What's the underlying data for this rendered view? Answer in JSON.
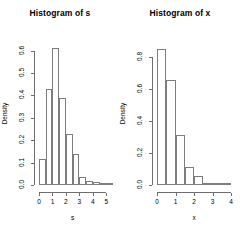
{
  "figure": {
    "background": "#ffffff",
    "axis_color": "#6e6e6e",
    "bar_border_color": "#7d7d7d",
    "text_color": "#000000",
    "panel_count": 2
  },
  "chart_data": [
    {
      "type": "bar",
      "subtype": "histogram",
      "panel": "left",
      "title": "Histogram of s",
      "xlabel": "s",
      "ylabel": "Density",
      "grid": false,
      "legend": false,
      "xlim": [
        0,
        5.5
      ],
      "ylim": [
        0,
        0.63
      ],
      "xticks": [
        0,
        1,
        2,
        3,
        4,
        5
      ],
      "xticklabels": [
        "0",
        "1",
        "2",
        "3",
        "4",
        "5"
      ],
      "yticks": [
        0.0,
        0.1,
        0.2,
        0.3,
        0.4,
        0.5,
        0.6
      ],
      "yticklabels": [
        "0.0",
        "0.1",
        "0.2",
        "0.3",
        "0.4",
        "0.5",
        "0.6"
      ],
      "bin_width": 0.5,
      "bin_edges": [
        0,
        0.5,
        1.0,
        1.5,
        2.0,
        2.5,
        3.0,
        3.5,
        4.0,
        4.5,
        5.0,
        5.5
      ],
      "categories": [
        "0-0.5",
        "0.5-1",
        "1-1.5",
        "1.5-2",
        "2-2.5",
        "2.5-3",
        "3-3.5",
        "3.5-4",
        "4-4.5",
        "4.5-5",
        "5-5.5"
      ],
      "values": [
        0.118,
        0.43,
        0.61,
        0.39,
        0.228,
        0.14,
        0.035,
        0.018,
        0.012,
        0.006,
        0.004
      ]
    },
    {
      "type": "bar",
      "subtype": "histogram",
      "panel": "right",
      "title": "Histogram of x",
      "xlabel": "x",
      "ylabel": "Density",
      "grid": false,
      "legend": false,
      "xlim": [
        0,
        4.0
      ],
      "ylim": [
        0,
        0.88
      ],
      "xticks": [
        0,
        1,
        2,
        3,
        4
      ],
      "xticklabels": [
        "0",
        "1",
        "2",
        "3",
        "4"
      ],
      "yticks": [
        0.0,
        0.2,
        0.4,
        0.6,
        0.8
      ],
      "yticklabels": [
        "0.0",
        "0.2",
        "0.4",
        "0.6",
        "0.8"
      ],
      "bin_width": 0.5,
      "bin_edges": [
        0,
        0.5,
        1.0,
        1.5,
        2.0,
        2.5,
        3.0,
        3.5,
        4.0
      ],
      "categories": [
        "0-0.5",
        "0.5-1",
        "1-1.5",
        "1.5-2",
        "2-2.5",
        "2.5-3",
        "3-3.5",
        "3.5-4"
      ],
      "values": [
        0.85,
        0.655,
        0.315,
        0.11,
        0.055,
        0.012,
        0.006,
        0.004
      ]
    }
  ]
}
